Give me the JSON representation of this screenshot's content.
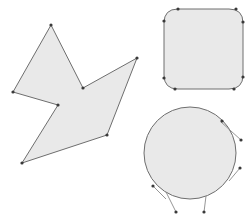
{
  "figure": {
    "background_color": "#ffffff",
    "width": 251,
    "height": 220,
    "fill_color": "#e9e9e9",
    "stroke_color": "#6e6e6e",
    "vertex_color": "#3a3a3a",
    "spur_color": "#8a8a8a",
    "vertex_radius": 1.6
  },
  "shapes": [
    {
      "name": "star-arrow-polygon",
      "type": "polygon",
      "points": "51,25 83,88 137,58 107,135 22,163 58,105 13,92",
      "vertices": [
        {
          "x": 51,
          "y": 25
        },
        {
          "x": 83,
          "y": 88
        },
        {
          "x": 137,
          "y": 58
        },
        {
          "x": 107,
          "y": 135
        },
        {
          "x": 22,
          "y": 163
        },
        {
          "x": 58,
          "y": 105
        },
        {
          "x": 13,
          "y": 92
        }
      ],
      "spurs": []
    },
    {
      "name": "rounded-square",
      "type": "rounded-rect",
      "path": "M 178,9 L 229,9 Q 243,9 243,23 L 243,75 Q 243,89 229,89 L 178,89 Q 164,89 164,75 L 164,23 Q 164,9 178,9 Z",
      "vertices": [
        {
          "x": 178,
          "y": 9
        },
        {
          "x": 236,
          "y": 9
        },
        {
          "x": 243,
          "y": 22
        },
        {
          "x": 243,
          "y": 77
        },
        {
          "x": 234,
          "y": 89
        },
        {
          "x": 175,
          "y": 89
        },
        {
          "x": 164,
          "y": 78
        },
        {
          "x": 164,
          "y": 21
        }
      ],
      "spurs": []
    },
    {
      "name": "circle-with-tangent-spurs",
      "type": "circle",
      "cx": 190,
      "cy": 153,
      "r": 46,
      "vertices": [
        {
          "x": 222,
          "y": 121
        },
        {
          "x": 241,
          "y": 140
        },
        {
          "x": 240,
          "y": 168
        },
        {
          "x": 204,
          "y": 212
        },
        {
          "x": 176,
          "y": 212
        },
        {
          "x": 153,
          "y": 186
        }
      ],
      "spurs": [
        {
          "x1": 221,
          "y1": 122,
          "x2": 241,
          "y2": 140
        },
        {
          "x1": 229,
          "y1": 181,
          "x2": 240,
          "y2": 168
        },
        {
          "x1": 206,
          "y1": 196,
          "x2": 204,
          "y2": 212
        },
        {
          "x1": 166,
          "y1": 192,
          "x2": 176,
          "y2": 212
        },
        {
          "x1": 153,
          "y1": 186,
          "x2": 166,
          "y2": 199
        }
      ]
    }
  ]
}
